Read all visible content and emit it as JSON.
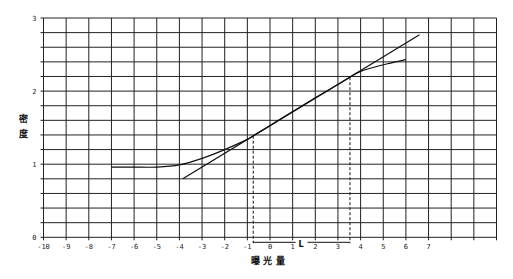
{
  "chart_data": {
    "type": "line",
    "title": "",
    "xlabel": "曝 光 量",
    "ylabel": "密 度",
    "xlim": [
      -10,
      10
    ],
    "ylim": [
      0,
      3
    ],
    "grid": true,
    "x_ticks": [
      -10,
      -9,
      -8,
      -7,
      -6,
      -5,
      -4,
      -3,
      -2,
      -1,
      0,
      1,
      2,
      3,
      4,
      5,
      6,
      7
    ],
    "y_ticks": [
      0,
      1,
      2,
      3
    ],
    "y_minor_step": 0.2,
    "series": [
      {
        "name": "characteristic curve",
        "points": [
          [
            -7,
            0.96
          ],
          [
            -6,
            0.96
          ],
          [
            -5,
            0.96
          ],
          [
            -4,
            0.99
          ],
          [
            -3,
            1.08
          ],
          [
            -2,
            1.2
          ],
          [
            -1,
            1.34
          ],
          [
            -0.74,
            1.39
          ],
          [
            0,
            1.53
          ],
          [
            1,
            1.72
          ],
          [
            2,
            1.91
          ],
          [
            3,
            2.09
          ],
          [
            3.53,
            2.19
          ],
          [
            4,
            2.27
          ],
          [
            5,
            2.36
          ],
          [
            6,
            2.43
          ]
        ]
      },
      {
        "name": "tangent line",
        "points": [
          [
            -3.85,
            0.8
          ],
          [
            6.6,
            2.77
          ]
        ]
      }
    ],
    "annotations": [
      {
        "type": "dashed-vline",
        "x": -0.74,
        "y_top": 1.39
      },
      {
        "type": "dashed-vline",
        "x": 3.53,
        "y_top": 2.19
      },
      {
        "type": "span",
        "from": -0.74,
        "to": 3.53,
        "label": "L"
      }
    ]
  },
  "axis": {
    "xlabel": "曝 光 量",
    "ylabel_top": "密",
    "ylabel_bottom": "度",
    "span_label": "L"
  }
}
